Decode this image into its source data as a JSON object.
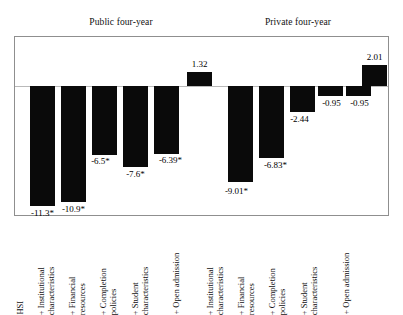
{
  "figure": {
    "background": "#ffffff",
    "bar_color": "#0a0a0a",
    "frame_color": "#8f8f8f",
    "zero_line_color": "#b9b9b9"
  },
  "panels": [
    {
      "title": "Public four-year"
    },
    {
      "title": "Private four-year"
    }
  ],
  "axis": {
    "categories": [
      "HSI",
      "+ Institutional\ncharacteristics",
      "+ Financial\nresources",
      "+ Completion\npolicies",
      "+ Student\ncharacteristics",
      "+ Open admission",
      "+ Institutional\ncharacteristics",
      "+ Financial\nresources",
      "+ Completion\npolicies",
      "+ Student\ncharacteristics",
      "+ Open admission"
    ]
  },
  "chart_data": {
    "type": "bar",
    "title": "",
    "subtitle": "",
    "xlabel": "",
    "ylabel": "",
    "grid": false,
    "legend": "none",
    "ylim": [
      -13,
      3
    ],
    "zero_line": 0,
    "panels": [
      {
        "name": "Public four-year",
        "categories": [
          "HSI",
          "+ Institutional characteristics",
          "+ Financial resources",
          "+ Completion policies",
          "+ Student characteristics",
          "+ Open admission"
        ],
        "values": [
          -11.3,
          -10.9,
          -6.5,
          -7.6,
          -6.39,
          1.32
        ],
        "labels": [
          "-11.3*",
          "-10.9*",
          "-6.5*",
          "-7.6*",
          "-6.39*",
          "1.32"
        ],
        "significant": [
          true,
          true,
          true,
          true,
          true,
          false
        ]
      },
      {
        "name": "Private four-year",
        "categories": [
          "+ Institutional characteristics",
          "+ Financial resources",
          "+ Completion policies",
          "+ Student characteristics",
          "+ Open admission"
        ],
        "values": [
          -9.01,
          -6.83,
          -2.44,
          -0.95,
          -0.95,
          2.01
        ],
        "labels": [
          "-9.01*",
          "-6.83*",
          "-2.44",
          "-0.95",
          "-0.95",
          "2.01"
        ],
        "significant": [
          true,
          true,
          false,
          false,
          false,
          false
        ]
      }
    ]
  },
  "bars": [
    {
      "id": "public-hsi",
      "label": "-11.3*",
      "value": -11.3
    },
    {
      "id": "public-institutional",
      "label": "-10.9*",
      "value": -10.9
    },
    {
      "id": "public-financial",
      "label": "-6.5*",
      "value": -6.5
    },
    {
      "id": "public-completion",
      "label": "-7.6*",
      "value": -7.6
    },
    {
      "id": "public-student",
      "label": "-6.39*",
      "value": -6.39
    },
    {
      "id": "public-open-admission",
      "label": "1.32",
      "value": 1.32
    },
    {
      "id": "private-institutional",
      "label": "-9.01*",
      "value": -9.01
    },
    {
      "id": "private-financial",
      "label": "-6.83*",
      "value": -6.83
    },
    {
      "id": "private-completion",
      "label": "-2.44",
      "value": -2.44
    },
    {
      "id": "private-student",
      "label": "-0.95",
      "value": -0.95
    },
    {
      "id": "private-open-1",
      "label": "-0.95",
      "value": -0.95
    },
    {
      "id": "private-open-2",
      "label": "2.01",
      "value": 2.01
    }
  ]
}
